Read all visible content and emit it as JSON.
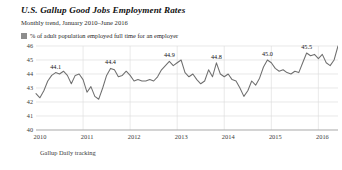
{
  "header": {
    "title": "U.S. Gallup Good Jobs Employment Rates",
    "subtitle": "Monthly trend, January 2010–June 2016"
  },
  "legend": {
    "swatch_icon": "legend-swatch-icon",
    "label": "% of adult population employed full time for an employer",
    "color": "#8d8d8d"
  },
  "source": {
    "text": "Gallup Daily tracking"
  },
  "chart_data": {
    "type": "line",
    "title": "U.S. Gallup Good Jobs Employment Rates",
    "subtitle": "Monthly trend, January 2010–June 2016",
    "xlabel": "",
    "ylabel": "",
    "ylim": [
      40,
      46
    ],
    "yticks": [
      46,
      45,
      44,
      43,
      42,
      41,
      40
    ],
    "ytick_labels": [
      "46",
      "45",
      "44",
      "43",
      "42",
      "41",
      "40"
    ],
    "xticks": [
      2010,
      2011,
      2012,
      2013,
      2014,
      2015,
      2016
    ],
    "xtick_labels": [
      "2010",
      "2011",
      "2012",
      "2013",
      "2014",
      "2015",
      "2016"
    ],
    "grid": true,
    "legend_position": "top-left",
    "series": [
      {
        "name": "% of adult population employed full time for an employer",
        "color": "#6f6f6f",
        "x": [
          "2010-01",
          "2010-02",
          "2010-03",
          "2010-04",
          "2010-05",
          "2010-06",
          "2010-07",
          "2010-08",
          "2010-09",
          "2010-10",
          "2010-11",
          "2010-12",
          "2011-01",
          "2011-02",
          "2011-03",
          "2011-04",
          "2011-05",
          "2011-06",
          "2011-07",
          "2011-08",
          "2011-09",
          "2011-10",
          "2011-11",
          "2011-12",
          "2012-01",
          "2012-02",
          "2012-03",
          "2012-04",
          "2012-05",
          "2012-06",
          "2012-07",
          "2012-08",
          "2012-09",
          "2012-10",
          "2012-11",
          "2012-12",
          "2013-01",
          "2013-02",
          "2013-03",
          "2013-04",
          "2013-05",
          "2013-06",
          "2013-07",
          "2013-08",
          "2013-09",
          "2013-10",
          "2013-11",
          "2013-12",
          "2014-01",
          "2014-02",
          "2014-03",
          "2014-04",
          "2014-05",
          "2014-06",
          "2014-07",
          "2014-08",
          "2014-09",
          "2014-10",
          "2014-11",
          "2014-12",
          "2015-01",
          "2015-02",
          "2015-03",
          "2015-04",
          "2015-05",
          "2015-06",
          "2015-07",
          "2015-08",
          "2015-09",
          "2015-10",
          "2015-11",
          "2015-12",
          "2016-01",
          "2016-02",
          "2016-03",
          "2016-04",
          "2016-05",
          "2016-06"
        ],
        "values": [
          42.6,
          42.3,
          42.8,
          43.5,
          43.9,
          44.1,
          44.0,
          44.2,
          43.9,
          43.3,
          43.9,
          44.0,
          43.6,
          42.7,
          43.1,
          42.4,
          42.2,
          43.0,
          43.9,
          44.4,
          44.3,
          43.8,
          43.9,
          44.2,
          43.9,
          43.5,
          43.6,
          43.5,
          43.5,
          43.6,
          43.5,
          43.8,
          44.3,
          44.6,
          44.9,
          44.6,
          44.8,
          45.0,
          44.1,
          43.8,
          44.0,
          43.6,
          43.3,
          43.5,
          44.3,
          43.8,
          44.8,
          44.0,
          43.8,
          44.0,
          43.6,
          43.5,
          43.0,
          42.4,
          42.8,
          43.5,
          43.2,
          43.7,
          44.5,
          45.0,
          44.8,
          44.4,
          44.2,
          44.3,
          44.1,
          44.0,
          44.2,
          44.1,
          44.8,
          45.5,
          45.3,
          45.4,
          45.1,
          45.4,
          44.8,
          44.6,
          45.0,
          46.0
        ]
      }
    ],
    "point_labels": [
      {
        "x": "2010-06",
        "value": 44.1,
        "text": "44.1"
      },
      {
        "x": "2011-08",
        "value": 44.4,
        "text": "44.4"
      },
      {
        "x": "2012-11",
        "value": 44.9,
        "text": "44.9"
      },
      {
        "x": "2013-11",
        "value": 44.8,
        "text": "44.8"
      },
      {
        "x": "2014-12",
        "value": 45.0,
        "text": "45.0"
      },
      {
        "x": "2015-10",
        "value": 45.5,
        "text": "45.5"
      },
      {
        "x": "2016-06",
        "value": 46.0,
        "text": "46.0"
      }
    ]
  }
}
